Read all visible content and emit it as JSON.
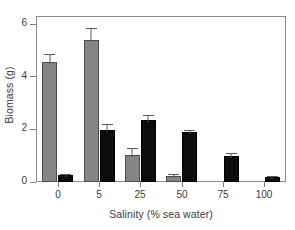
{
  "chart_data": {
    "type": "bar",
    "title": "",
    "xlabel": "Salinity (% sea water)",
    "ylabel": "Biomass (g)",
    "categories": [
      "0",
      "5",
      "25",
      "50",
      "75",
      "100"
    ],
    "ylim": [
      0,
      6
    ],
    "yticks": [
      0,
      2,
      4,
      6
    ],
    "ytick_labels": [
      "0",
      "2",
      "4",
      "6"
    ],
    "grid": false,
    "legend": "none",
    "series": [
      {
        "name": "gray",
        "color": "#858585",
        "values": [
          4.55,
          5.4,
          1.03,
          0.22,
          0.0,
          0.0
        ],
        "errors": [
          0.33,
          0.45,
          0.28,
          0.07,
          0.0,
          0.0
        ]
      },
      {
        "name": "black",
        "color": "#0d0d0d",
        "values": [
          0.25,
          1.97,
          2.35,
          1.9,
          1.0,
          0.2
        ],
        "errors": [
          0.06,
          0.23,
          0.18,
          0.08,
          0.1,
          0.04
        ]
      }
    ]
  },
  "axis": {
    "y_title": "Biomass (g)",
    "x_title": "Salinity (% sea water)"
  }
}
